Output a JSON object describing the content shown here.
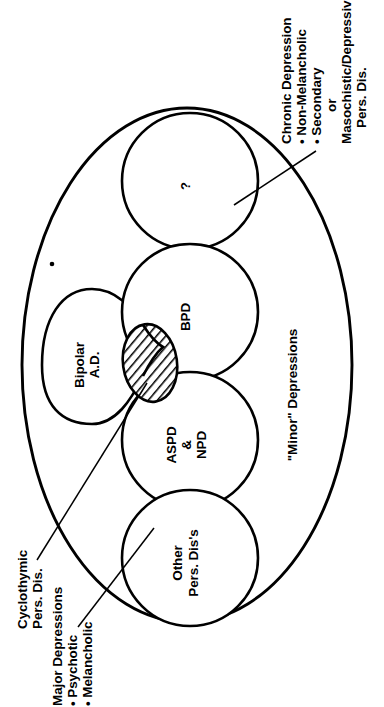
{
  "figure": {
    "type": "venn-overlap-diagram",
    "orientation": "rotated-90-ccw",
    "background_color": "#ffffff",
    "line_color": "#000000",
    "outer_region": {
      "name": "minor-depressions",
      "label": "\"Minor\" Depressions",
      "shape": "ellipse"
    },
    "regions": [
      {
        "id": "unknown",
        "label": "?",
        "shape": "circle",
        "fill": "none"
      },
      {
        "id": "bpd",
        "label": "BPD",
        "shape": "circle",
        "fill": "none"
      },
      {
        "id": "aspd-npd",
        "label_lines": [
          "ASPD",
          "&",
          "NPD"
        ],
        "shape": "circle",
        "fill": "none"
      },
      {
        "id": "other-pers-dis",
        "label_lines": [
          "Other",
          "Pers. Dis's"
        ],
        "shape": "circle",
        "fill": "none"
      },
      {
        "id": "bipolar-ad",
        "label_lines": [
          "Bipolar",
          "A.D."
        ],
        "shape": "lobed-blob",
        "fill": "none"
      },
      {
        "id": "cyclothymic-overlap",
        "label": "",
        "shape": "ellipse",
        "fill": "diagonal-hatching"
      }
    ],
    "callouts": [
      {
        "id": "chronic-depression",
        "lines": [
          "Chronic Depression",
          "• Non-Melancholic",
          "• Secondary",
          "or",
          "Masochistic/Depressive",
          "Pers. Dis."
        ],
        "points_to": "unknown"
      },
      {
        "id": "cyclothymic",
        "lines": [
          "Cyclothymic",
          "Pers. Dis."
        ],
        "points_to": "cyclothymic-overlap"
      },
      {
        "id": "major-depressions",
        "lines": [
          "Major Depressions",
          "• Psychotic",
          "• Melancholic"
        ],
        "points_to": "other-pers-dis"
      }
    ]
  },
  "labels": {
    "minor_depressions": "\"Minor\" Depressions",
    "question_mark": "?",
    "bpd": "BPD",
    "aspd": "ASPD",
    "ampersand": "&",
    "npd": "NPD",
    "other_line1": "Other",
    "other_line2": "Pers. Dis's",
    "bipolar_line1": "Bipolar",
    "bipolar_line2": "A.D.",
    "chronic_line1": "Chronic Depression",
    "chronic_line2": "• Non-Melancholic",
    "chronic_line3": "• Secondary",
    "chronic_line4": "or",
    "chronic_line5": "Masochistic/Depressive",
    "chronic_line6": "Pers. Dis.",
    "cyclothymic_line1": "Cyclothymic",
    "cyclothymic_line2": "Pers. Dis.",
    "major_line1": "Major Depressions",
    "major_line2": "• Psychotic",
    "major_line3": "• Melancholic"
  }
}
